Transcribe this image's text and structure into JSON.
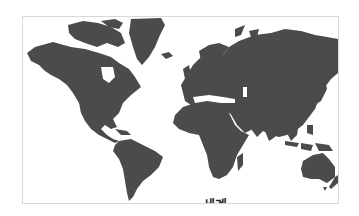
{
  "map": {
    "type": "world-map",
    "projection": "mercator",
    "label": "세계",
    "land_color": "#4b4b4b",
    "water_color": "#ffffff",
    "border_color": "#d8d8d8",
    "regions": [
      "north-america",
      "greenland",
      "south-america",
      "europe",
      "africa",
      "asia",
      "australia",
      "new-zealand",
      "madagascar",
      "japan",
      "indonesia"
    ]
  }
}
